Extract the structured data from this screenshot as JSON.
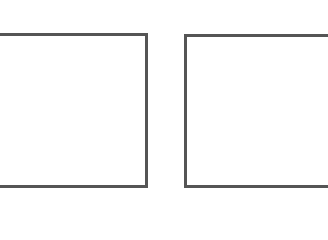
{
  "panels": [
    {
      "id": "left",
      "border_color": "#555555",
      "fill": "#ffffff"
    },
    {
      "id": "right",
      "border_color": "#555555",
      "fill": "#ffffff"
    }
  ],
  "background": "#ffffff"
}
